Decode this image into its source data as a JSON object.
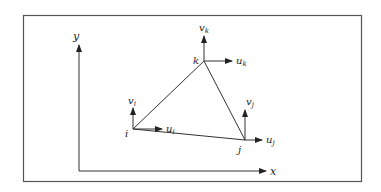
{
  "diagram": {
    "type": "triangular-element-nodal-displacements",
    "colors": {
      "stroke": "#333333",
      "frame": "#555555",
      "background": "#ffffff"
    },
    "axes": {
      "x_label": "x",
      "y_label": "y",
      "origin": [
        79,
        171
      ]
    },
    "frame": {
      "x": 23,
      "y": 15,
      "width": 339,
      "height": 167
    },
    "nodes": [
      {
        "id": "i",
        "label": "i",
        "pos": [
          133,
          129
        ],
        "u_label": "u",
        "u_sub": "i",
        "v_label": "v",
        "v_sub": "i"
      },
      {
        "id": "j",
        "label": "j",
        "pos": [
          245,
          140
        ],
        "u_label": "u",
        "u_sub": "j",
        "v_label": "v",
        "v_sub": "j"
      },
      {
        "id": "k",
        "label": "k",
        "pos": [
          204,
          61
        ],
        "u_label": "u",
        "u_sub": "k",
        "v_label": "v",
        "v_sub": "k"
      }
    ],
    "edges": [
      [
        "i",
        "j"
      ],
      [
        "j",
        "k"
      ],
      [
        "k",
        "i"
      ]
    ]
  }
}
